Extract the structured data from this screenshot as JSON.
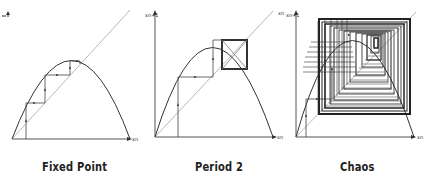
{
  "panels": [
    {
      "id": "fixed-point",
      "caption": "Fixed Point",
      "x_axis_label": "xn",
      "y_axis_label": "xn+1",
      "diagonal_label": "xn"
    },
    {
      "id": "period-2",
      "caption": "Period 2",
      "x_axis_label": "xn",
      "y_axis_label": "xn+1",
      "diagonal_label": "xn"
    },
    {
      "id": "chaos",
      "caption": "Chaos",
      "x_axis_label": "xn",
      "y_axis_label": "xn+1",
      "diagonal_label": "xn"
    }
  ],
  "colors": {
    "curve": "#333333",
    "diagonal": "#b0b0b0",
    "axes": "#555555",
    "cobweb": "#444444",
    "caption": "#222222"
  }
}
